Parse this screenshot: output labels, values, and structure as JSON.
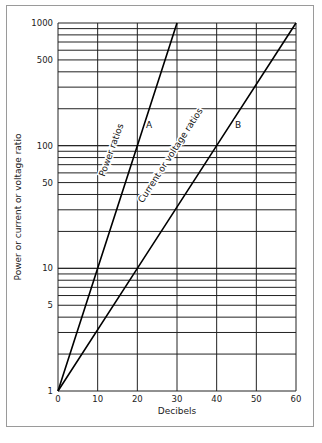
{
  "chart_data": {
    "type": "line",
    "title": "",
    "xlabel": "Decibels",
    "ylabel": "Power or current or voltage ratio",
    "xlim": [
      0,
      60
    ],
    "ylim": [
      1,
      1000
    ],
    "yscale": "log",
    "grid": true,
    "x_ticks": [
      "0",
      "10",
      "20",
      "30",
      "40",
      "50",
      "60"
    ],
    "y_ticks": [
      "1",
      "5",
      "10",
      "50",
      "100",
      "500",
      "1000"
    ],
    "series": [
      {
        "name": "Power ratios",
        "marker_label": "A",
        "x": [
          0,
          10,
          20,
          30
        ],
        "y": [
          1,
          10,
          100,
          1000
        ]
      },
      {
        "name": "Current or voltage ratios",
        "marker_label": "B",
        "x": [
          0,
          20,
          40,
          60
        ],
        "y": [
          1,
          10,
          100,
          1000
        ]
      }
    ]
  }
}
